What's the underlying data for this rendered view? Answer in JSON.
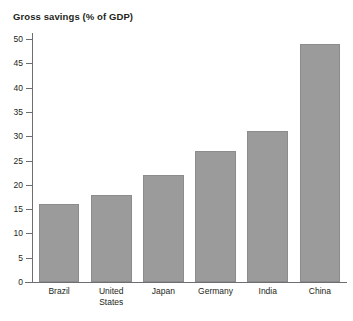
{
  "chart_data": {
    "type": "bar",
    "title": "Gross savings (% of GDP)",
    "xlabel": "",
    "ylabel": "",
    "categories": [
      "Brazil",
      "United States",
      "Japan",
      "Germany",
      "India",
      "China"
    ],
    "category_lines": [
      [
        "Brazil"
      ],
      [
        "United",
        "States"
      ],
      [
        "Japan"
      ],
      [
        "Germany"
      ],
      [
        "India"
      ],
      [
        "China"
      ]
    ],
    "values": [
      16,
      18,
      22,
      27,
      31,
      49
    ],
    "ylim": [
      0,
      50
    ],
    "ytick_step": 5,
    "yticks": [
      0,
      5,
      10,
      15,
      20,
      25,
      30,
      35,
      40,
      45,
      50
    ],
    "ytick_labels": [
      "0",
      "5",
      "10",
      "15",
      "20",
      "25",
      "30",
      "35",
      "40",
      "45",
      "50"
    ],
    "grid": false,
    "legend": null,
    "bar_color": "#9b9b9b",
    "bar_edge_color": "#8c8c8c",
    "axis_color": "#6d6e71",
    "text_color": "#231f20"
  }
}
